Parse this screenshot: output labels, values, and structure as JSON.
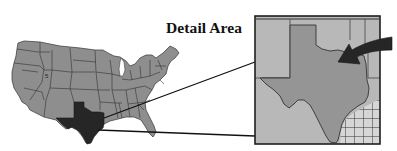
{
  "figure": {
    "title": "Detail Area",
    "overview_map": {
      "label": "United States overview map",
      "highlighted_state": "Texas",
      "colors": {
        "states_fill": "#8e8e8e",
        "state_borders": "#333333",
        "highlight_fill": "#2a2a2a"
      }
    },
    "detail_map": {
      "label": "Texas detail map",
      "arrow": "pointer-arrow",
      "colors": {
        "texas_fill": "#959595",
        "neighbors_fill": "#b7b7b7",
        "gulf_hatch_fill": "#d4d4d4",
        "frame": "#222222"
      },
      "gulf_pattern": "grid-hatch"
    },
    "connectors": {
      "count": 2,
      "color": "#111111"
    }
  }
}
